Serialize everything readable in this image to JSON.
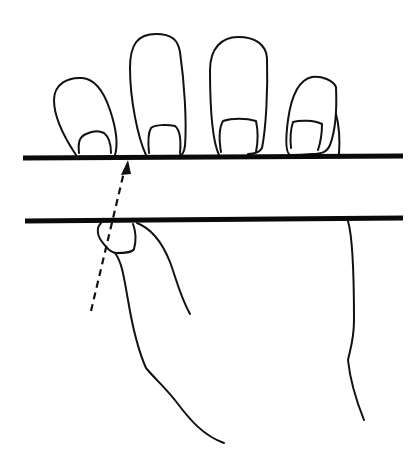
{
  "figure": {
    "colors": {
      "background": "#ffffff",
      "ink": "#111111"
    },
    "elements": {
      "upper_line": "upper horizontal bar line",
      "lower_line": "lower horizontal bar line",
      "fingers": [
        "index finger",
        "middle finger",
        "ring finger",
        "little finger"
      ],
      "thumb": "thumb with nail below lower line",
      "arrow": "dashed arrow pointing up to upper line"
    }
  }
}
